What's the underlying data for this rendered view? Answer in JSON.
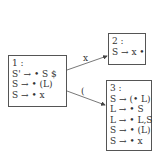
{
  "states": [
    {
      "id": "1",
      "label": "1 :",
      "items": [
        "S' → • S $",
        "S → • (L)",
        "S → • x"
      ]
    },
    {
      "id": "2",
      "label": "2 :",
      "items": [
        "S → x •"
      ]
    },
    {
      "id": "3",
      "label": "3 :",
      "items": [
        "S → (• L)",
        "L → • S",
        "L → • L,S",
        "S → • (L)",
        "S → • x"
      ]
    }
  ],
  "transitions": [
    {
      "from": "1",
      "to": "2",
      "symbol": "x"
    },
    {
      "from": "1",
      "to": "3",
      "symbol": "("
    }
  ]
}
